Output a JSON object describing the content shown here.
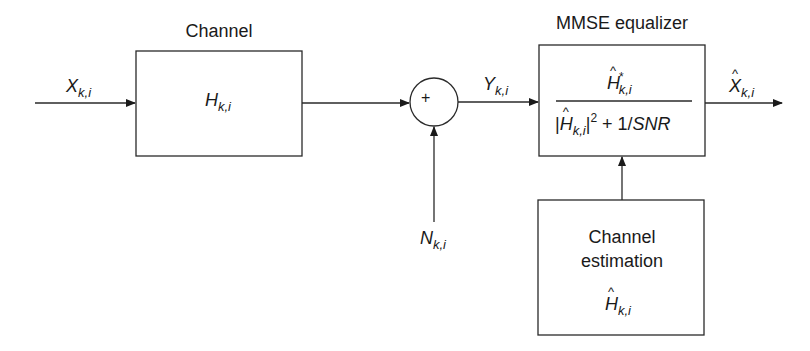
{
  "diagram": {
    "labels": {
      "channel_title": "Channel",
      "equalizer_title": "MMSE equalizer",
      "channel_block": {
        "symbol": "H",
        "subscript": "k,i"
      },
      "input": {
        "symbol": "X",
        "subscript": "k,i"
      },
      "noise": {
        "symbol": "N",
        "subscript": "k,i"
      },
      "received": {
        "symbol": "Y",
        "subscript": "k,i"
      },
      "output": {
        "symbol": "X",
        "subscript": "k,i",
        "accent": "hat"
      },
      "summing_junction": "+",
      "equalizer_formula": {
        "numerator": {
          "symbol": "H",
          "subscript": "k,i",
          "accent": "hat",
          "superscript": "*"
        },
        "denominator": {
          "symbol": "H",
          "subscript": "k,i",
          "accent": "hat",
          "power": "2",
          "rest": " + 1/",
          "snr": "SNR"
        }
      },
      "estimation_block": {
        "line1": "Channel",
        "line2": "estimation",
        "symbol": "H",
        "subscript": "k,i",
        "accent": "hat"
      }
    },
    "colors": {
      "stroke": "#2a2a2a",
      "background": "#ffffff"
    }
  }
}
